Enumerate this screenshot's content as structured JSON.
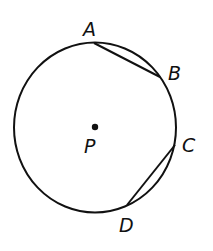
{
  "diagram": {
    "type": "circle-chords",
    "center": {
      "label": "P",
      "x": 95,
      "y": 127
    },
    "circle": {
      "cx": 95,
      "cy": 127.5,
      "rx": 81,
      "ry": 85
    },
    "points": [
      {
        "label": "A",
        "x": 94,
        "y": 43
      },
      {
        "label": "B",
        "x": 160,
        "y": 77
      },
      {
        "label": "C",
        "x": 175,
        "y": 145
      },
      {
        "label": "D",
        "x": 127,
        "y": 205
      }
    ],
    "chords": [
      {
        "from": "A",
        "to": "B"
      },
      {
        "from": "C",
        "to": "D"
      }
    ],
    "colors": {
      "stroke": "#111111",
      "background": "#ffffff"
    }
  },
  "labels": {
    "A": "A",
    "B": "B",
    "C": "C",
    "D": "D",
    "P": "P"
  }
}
